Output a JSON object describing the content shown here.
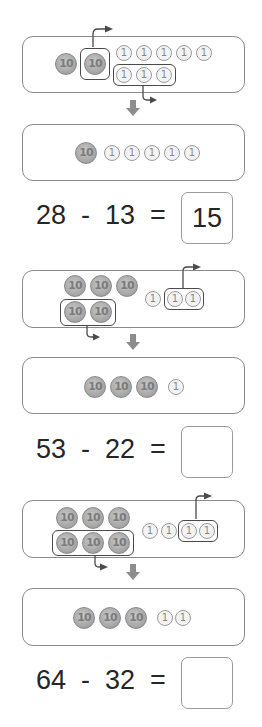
{
  "problems": [
    {
      "minuend": 28,
      "subtrahend": 13,
      "equation": "28  -  13  =",
      "answer": "15",
      "before": {
        "tens": 2,
        "ones": 8,
        "removed_tens": 1,
        "removed_ones": 3
      },
      "after": {
        "tens": 1,
        "ones": 5
      }
    },
    {
      "minuend": 53,
      "subtrahend": 22,
      "equation": "53  -  22  =",
      "answer": "",
      "before": {
        "tens": 5,
        "ones": 3,
        "removed_tens": 2,
        "removed_ones": 2
      },
      "after": {
        "tens": 3,
        "ones": 1
      }
    },
    {
      "minuend": 64,
      "subtrahend": 32,
      "equation": "64  -  32  =",
      "answer": "",
      "before": {
        "tens": 6,
        "ones": 4,
        "removed_tens": 3,
        "removed_ones": 2
      },
      "after": {
        "tens": 3,
        "ones": 2
      }
    }
  ],
  "coin_labels": {
    "ten": "10",
    "one": "1"
  },
  "icons": {
    "down_arrow": "down-arrow-icon",
    "take_away_arrow": "take-away-arrow-icon"
  },
  "colors": {
    "coin10": "#a9a9a9",
    "coin1": "#f3f3f3",
    "border": "#8a8a8a",
    "group": "#4a4a4a",
    "arrow": "#8c8c8c"
  }
}
